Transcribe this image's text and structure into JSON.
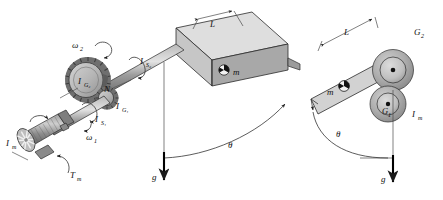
{
  "figure": {
    "background_color": "#ffffff",
    "ink_color": "#2b2b2b"
  },
  "left_view": {
    "name": "isometric-view",
    "motor": {
      "inertia_label": "I",
      "inertia_sub": "m",
      "torque_label": "T",
      "torque_sub": "m",
      "speed_label": "ω",
      "speed_sub": "1"
    },
    "shaft1": {
      "inertia_label": "I",
      "inertia_sub": "S₁"
    },
    "gear1": {
      "label": "I",
      "sub": "G₁"
    },
    "gear2": {
      "label": "I",
      "sub": "G₂",
      "speed_label": "ω",
      "speed_sub": "2"
    },
    "gear_ratio_label": "N",
    "shaft2": {
      "inertia_label": "I",
      "inertia_sub": "S₂"
    },
    "beam": {
      "length_label": "L",
      "mass_label": "m"
    },
    "angle_label": "θ",
    "gravity_label": "g"
  },
  "right_view": {
    "name": "side-view",
    "beam": {
      "length_label": "L",
      "mass_label": "m"
    },
    "gear2_label": "G",
    "gear2_sub": "2",
    "gear1_label": "G",
    "gear1_sub": "1",
    "motor_inertia_label": "I",
    "motor_inertia_sub": "m",
    "angle_label": "θ",
    "gravity_label": "g"
  },
  "colors": {
    "beam_top": "#d7d7d7",
    "beam_front": "#c2c2c2",
    "beam_side": "#9a9a9a",
    "shaft": "#9e9e9e",
    "gear_body": "#bdbdbd",
    "gear_teeth": "#6e6e6e",
    "motor_body": "#8a8a8a",
    "disc_outer": "#a8a8a8",
    "disc_inner": "#c9c9c9"
  }
}
